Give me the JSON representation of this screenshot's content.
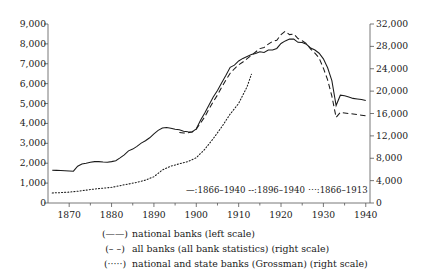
{
  "chart_data": {
    "type": "line",
    "title": "",
    "xlabel": "",
    "ylabel": "",
    "ylabel_right": "",
    "grid": false,
    "xlim": [
      1865,
      1941
    ],
    "ylim": [
      0,
      9000
    ],
    "ylim_right": [
      0,
      32000
    ],
    "xticks": [
      1870,
      1880,
      1890,
      1900,
      1910,
      1920,
      1930,
      1940
    ],
    "xtick_labels": [
      "1870",
      "1880",
      "1890",
      "1900",
      "1910",
      "1920",
      "1930",
      "1940"
    ],
    "xminor_ticks": [
      1875,
      1885,
      1895,
      1905,
      1915,
      1925,
      1935
    ],
    "yticks_left": [
      0,
      1000,
      2000,
      3000,
      4000,
      5000,
      6000,
      7000,
      8000,
      9000
    ],
    "ytick_labels_left": [
      "0",
      "1,000",
      "2,000",
      "3,000",
      "4,000",
      "5,000",
      "6,000",
      "7,000",
      "8,000",
      "9,000"
    ],
    "yticks_right": [
      0,
      4000,
      8000,
      12000,
      16000,
      20000,
      24000,
      28000,
      32000
    ],
    "ytick_labels_right": [
      "0",
      "4,000",
      "8,000",
      "12,000",
      "16,000",
      "20,000",
      "24,000",
      "28,000",
      "32,000"
    ],
    "legend_position": "below-axes",
    "series": [
      {
        "name": "national banks (left scale)",
        "style": "solid",
        "axis": "left",
        "range_label": "1866-1940",
        "x": [
          1866,
          1867,
          1868,
          1869,
          1870,
          1871,
          1872,
          1873,
          1874,
          1875,
          1876,
          1877,
          1878,
          1879,
          1880,
          1881,
          1882,
          1883,
          1884,
          1885,
          1886,
          1887,
          1888,
          1889,
          1890,
          1891,
          1892,
          1893,
          1894,
          1895,
          1896,
          1897,
          1898,
          1899,
          1900,
          1901,
          1902,
          1903,
          1904,
          1905,
          1906,
          1907,
          1908,
          1909,
          1910,
          1911,
          1912,
          1913,
          1914,
          1915,
          1916,
          1917,
          1918,
          1919,
          1920,
          1921,
          1922,
          1923,
          1924,
          1925,
          1926,
          1927,
          1928,
          1929,
          1930,
          1931,
          1932,
          1933,
          1934,
          1935,
          1936,
          1937,
          1938,
          1939,
          1940
        ],
        "values": [
          1650,
          1640,
          1630,
          1620,
          1610,
          1600,
          1850,
          1960,
          2000,
          2050,
          2080,
          2080,
          2060,
          2050,
          2080,
          2130,
          2270,
          2420,
          2620,
          2710,
          2850,
          3010,
          3130,
          3280,
          3480,
          3650,
          3770,
          3800,
          3760,
          3710,
          3680,
          3610,
          3580,
          3570,
          3730,
          4160,
          4530,
          4930,
          5330,
          5660,
          6050,
          6420,
          6820,
          6930,
          7140,
          7270,
          7370,
          7470,
          7520,
          7600,
          7570,
          7690,
          7690,
          7770,
          8020,
          8150,
          8250,
          8240,
          8080,
          8070,
          7980,
          7790,
          7690,
          7530,
          7250,
          6800,
          6150,
          4900,
          5420,
          5390,
          5330,
          5260,
          5230,
          5200,
          5150
        ]
      },
      {
        "name": "all banks (all bank statistics) (right scale)",
        "style": "dashed",
        "axis": "right",
        "range_label": "1896-1940",
        "x": [
          1896,
          1897,
          1898,
          1899,
          1900,
          1901,
          1902,
          1903,
          1904,
          1905,
          1906,
          1907,
          1908,
          1909,
          1910,
          1911,
          1912,
          1913,
          1914,
          1915,
          1916,
          1917,
          1918,
          1919,
          1920,
          1921,
          1922,
          1923,
          1924,
          1925,
          1926,
          1927,
          1928,
          1929,
          1930,
          1931,
          1932,
          1933,
          1934,
          1935,
          1936,
          1937,
          1938,
          1939,
          1940
        ],
        "values": [
          12600,
          12500,
          12550,
          12700,
          13200,
          14300,
          15400,
          16800,
          18100,
          19300,
          20700,
          22000,
          23200,
          24000,
          24700,
          25200,
          25800,
          26400,
          27000,
          27600,
          27800,
          28400,
          28900,
          29100,
          30100,
          30700,
          30100,
          30200,
          29400,
          29000,
          28500,
          27500,
          26800,
          25900,
          24100,
          22000,
          19100,
          15300,
          16200,
          16100,
          16000,
          15900,
          15800,
          15700,
          15600
        ]
      },
      {
        "name": "national and state banks (Grossman) (right scale)",
        "style": "dotted",
        "axis": "right",
        "range_label": "1866-1913",
        "x": [
          1866,
          1868,
          1870,
          1872,
          1874,
          1876,
          1878,
          1880,
          1882,
          1884,
          1886,
          1888,
          1890,
          1892,
          1894,
          1896,
          1898,
          1900,
          1902,
          1904,
          1906,
          1908,
          1910,
          1912,
          1913
        ],
        "values": [
          1800,
          1850,
          1950,
          2100,
          2300,
          2500,
          2650,
          2800,
          3100,
          3400,
          3700,
          4100,
          4700,
          5900,
          6600,
          7000,
          7400,
          8100,
          9600,
          11500,
          13600,
          15900,
          17800,
          20800,
          23000
        ]
      }
    ],
    "inline_legend": [
      {
        "mark": "—",
        "label": ":1866–1940"
      },
      {
        "mark": "--",
        "label": ":1896–1940"
      },
      {
        "mark": "⋯",
        "label": ":1866–1913"
      }
    ],
    "bottom_legend": [
      {
        "mark": "(——)",
        "label": "national banks (left scale)"
      },
      {
        "mark": "(– –)",
        "label": "all banks (all bank statistics) (right scale)"
      },
      {
        "mark": "(·····)",
        "label": "national and state banks (Grossman) (right scale)"
      }
    ]
  }
}
